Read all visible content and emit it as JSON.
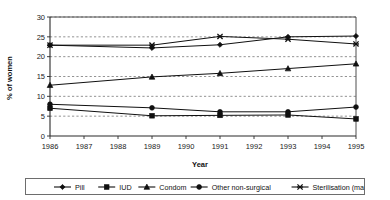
{
  "chart_data": {
    "type": "line",
    "title": "",
    "xlabel": "Year",
    "ylabel": "% of women",
    "xlim": [
      1986,
      1995
    ],
    "ylim": [
      0,
      30
    ],
    "yticks": [
      0,
      5,
      10,
      15,
      20,
      25,
      30
    ],
    "xticks": [
      1986,
      1987,
      1988,
      1989,
      1990,
      1991,
      1992,
      1993,
      1994,
      1995
    ],
    "grid": true,
    "legend_position": "bottom",
    "x": [
      1986,
      1989,
      1991,
      1993,
      1995
    ],
    "series": [
      {
        "name": "Pill",
        "marker": "diamond",
        "values": [
          22.9,
          22.2,
          23.0,
          25.0,
          25.2
        ]
      },
      {
        "name": "IUD",
        "marker": "square",
        "values": [
          7.0,
          5.1,
          5.2,
          5.3,
          4.3
        ]
      },
      {
        "name": "Condom",
        "marker": "triangle",
        "values": [
          12.8,
          14.9,
          15.8,
          17.0,
          18.2
        ]
      },
      {
        "name": "Other non-surgical",
        "marker": "circle",
        "values": [
          8.0,
          7.1,
          6.1,
          6.1,
          7.3
        ]
      },
      {
        "name": "Sterilisation (male/female)",
        "marker": "x",
        "values": [
          22.9,
          22.9,
          25.1,
          24.4,
          23.2
        ]
      }
    ]
  },
  "axis": {
    "y_title": "% of women",
    "x_title": "Year",
    "y_tick_labels": [
      "30",
      "25",
      "20",
      "15",
      "10",
      "5",
      "0"
    ],
    "x_tick_labels": [
      "1986",
      "1987",
      "1988",
      "1989",
      "1990",
      "1991",
      "1992",
      "1993",
      "1994",
      "1995"
    ]
  },
  "legend": {
    "items": [
      {
        "label": "Pill",
        "marker": "diamond"
      },
      {
        "label": "IUD",
        "marker": "square"
      },
      {
        "label": "Condom",
        "marker": "triangle"
      },
      {
        "label": "Other non-surgical",
        "marker": "circle"
      },
      {
        "label": "Sterilisation (male/female)",
        "marker": "x"
      }
    ]
  },
  "colors": {
    "ink": "#101010",
    "grid": "#4a4a4a",
    "frame": "#3a3a3a",
    "background": "#ffffff"
  }
}
